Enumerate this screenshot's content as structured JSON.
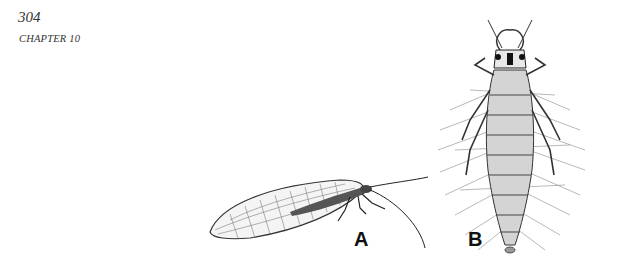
{
  "header": {
    "page_number": "304",
    "chapter": "CHAPTER 10"
  },
  "figure": {
    "panels": [
      {
        "label": "A",
        "subject": "adult-lacewing-illustration"
      },
      {
        "label": "B",
        "subject": "lacewing-larva-illustration"
      }
    ]
  }
}
